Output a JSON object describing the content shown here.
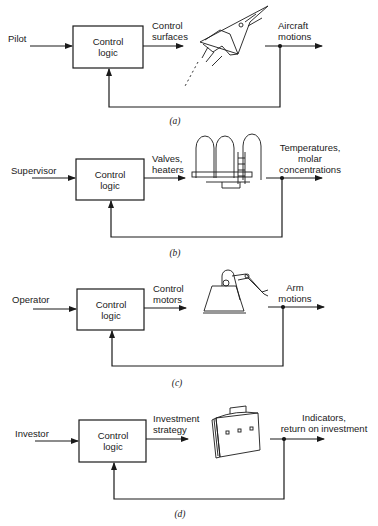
{
  "figure": {
    "panels": [
      {
        "id": "a",
        "caption": "(a)",
        "input_label": "Pilot",
        "controller_label_line1": "Control",
        "controller_label_line2": "logic",
        "actuation_label_line1": "Control",
        "actuation_label_line2": "surfaces",
        "plant_icon": "aircraft-icon",
        "output_label_line1": "Aircraft",
        "output_label_line2": "motions"
      },
      {
        "id": "b",
        "caption": "(b)",
        "input_label": "Supervisor",
        "controller_label_line1": "Control",
        "controller_label_line2": "logic",
        "actuation_label_line1": "Valves,",
        "actuation_label_line2": "heaters",
        "plant_icon": "chemical-reactor-icon",
        "output_label_line1": "Temperatures,",
        "output_label_line2": "molar",
        "output_label_line3": "concentrations"
      },
      {
        "id": "c",
        "caption": "(c)",
        "input_label": "Operator",
        "controller_label_line1": "Control",
        "controller_label_line2": "logic",
        "actuation_label_line1": "Control",
        "actuation_label_line2": "motors",
        "plant_icon": "robot-arm-icon",
        "output_label_line1": "Arm",
        "output_label_line2": "motions"
      },
      {
        "id": "d",
        "caption": "(d)",
        "input_label": "Investor",
        "controller_label_line1": "Control",
        "controller_label_line2": "logic",
        "actuation_label_line1": "Investment",
        "actuation_label_line2": "strategy",
        "plant_icon": "briefcase-icon",
        "output_label_line1": "Indicators,",
        "output_label_line2": "return on investment"
      }
    ]
  }
}
